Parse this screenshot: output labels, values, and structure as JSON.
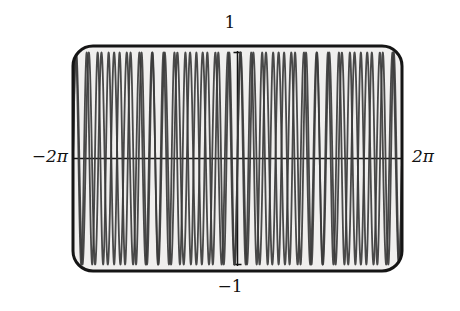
{
  "figure": {
    "title": "",
    "background_color": "#ffffff",
    "plot_background_color": "#f0efee",
    "frame_color": "#151515",
    "curve_color": "#3b3b3b"
  },
  "labels": {
    "y_max": "1",
    "y_min": "−1",
    "x_min": "−2π",
    "x_max": "2π"
  },
  "chart_data": {
    "type": "line",
    "title": "",
    "xlabel": "",
    "ylabel": "",
    "xlim": [
      -6.283185307179586,
      6.283185307179586
    ],
    "ylim": [
      -1,
      1
    ],
    "xtick_labels": [
      "−2π",
      "2π"
    ],
    "ytick_labels": [
      "−1",
      "1"
    ],
    "grid": false,
    "legend": "none",
    "axes_drawn": [
      "x-axis-horizontal-through-y0",
      "y-axis-vertical-through-x0"
    ],
    "series": [
      {
        "name": "sin(13x)",
        "expression": "sin(13x)",
        "amplitude": 1,
        "frequency": 13,
        "phase": 0,
        "color": "#3b3b3b",
        "line_width": 1.8,
        "samples": 2400
      },
      {
        "name": "sin(15x)",
        "expression": "sin(15x)",
        "amplitude": 1,
        "frequency": 15,
        "phase": 0,
        "color": "#3b3b3b",
        "line_width": 1.8,
        "samples": 2400
      }
    ],
    "annotations": [
      {
        "text": "1",
        "position": "top-center",
        "role": "y-axis-max-tick-label"
      },
      {
        "text": "−1",
        "position": "bottom-center",
        "role": "y-axis-min-tick-label"
      },
      {
        "text": "−2π",
        "position": "left-middle",
        "role": "x-axis-min-tick-label"
      },
      {
        "text": "2π",
        "position": "right-middle",
        "role": "x-axis-max-tick-label"
      }
    ]
  }
}
